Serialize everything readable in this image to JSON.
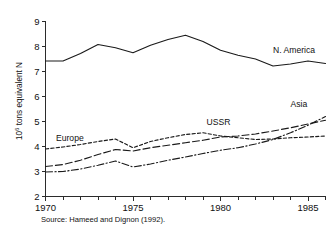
{
  "figure": {
    "caption": "Source: Hameed and Dignon (1992)."
  },
  "chart_data": {
    "type": "line",
    "title": "",
    "xlabel": "",
    "ylabel": "10⁶ tons equivalent N",
    "ylabel_base": "10",
    "ylabel_exponent": "6",
    "ylabel_rest": " tons equivalent N",
    "xlim": [
      1970,
      1986
    ],
    "ylim": [
      2,
      9
    ],
    "grid": false,
    "legend_position": "inline-labels",
    "y_ticks": [
      2,
      3,
      4,
      5,
      6,
      7,
      8,
      9
    ],
    "y_tick_labels": [
      "2",
      "3",
      "4",
      "5",
      "6",
      "7",
      "8",
      "9"
    ],
    "x_ticks_major": [
      1970,
      1975,
      1980,
      1985
    ],
    "x_tick_labels": [
      "1970",
      "1975",
      "1980",
      "1985"
    ],
    "x_ticks_minor": [
      1971,
      1972,
      1973,
      1974,
      1976,
      1977,
      1978,
      1979,
      1981,
      1982,
      1983,
      1984,
      1986
    ],
    "x": [
      1970,
      1971,
      1972,
      1973,
      1974,
      1975,
      1976,
      1977,
      1978,
      1979,
      1980,
      1981,
      1982,
      1983,
      1984,
      1985,
      1986
    ],
    "series": [
      {
        "name": "N. America",
        "label": "N. America",
        "style": "solid",
        "dasharray": "",
        "label_x": 1983.0,
        "label_y": 7.75,
        "values": [
          7.42,
          7.42,
          7.72,
          8.08,
          7.95,
          7.75,
          8.05,
          8.28,
          8.45,
          8.2,
          7.85,
          7.65,
          7.5,
          7.22,
          7.3,
          7.42,
          7.32
        ]
      },
      {
        "name": "Europe",
        "label": "Europe",
        "style": "short-dash",
        "dasharray": "3.2,2.2",
        "label_x": 1970.6,
        "label_y": 4.22,
        "values": [
          3.9,
          3.98,
          4.08,
          4.2,
          4.3,
          3.95,
          4.2,
          4.35,
          4.48,
          4.55,
          4.42,
          4.35,
          4.28,
          4.3,
          4.35,
          4.38,
          4.42
        ]
      },
      {
        "name": "USSR",
        "label": "USSR",
        "style": "long-dash",
        "dasharray": "7,3",
        "label_x": 1979.2,
        "label_y": 4.85,
        "values": [
          3.2,
          3.28,
          3.45,
          3.68,
          3.88,
          3.82,
          3.95,
          4.05,
          4.15,
          4.25,
          4.38,
          4.42,
          4.5,
          4.62,
          4.75,
          4.9,
          5.05
        ]
      },
      {
        "name": "Asia",
        "label": "Asia",
        "style": "dash-dot",
        "dasharray": "7,2.4,1.2,2.4",
        "label_x": 1984.0,
        "label_y": 5.58,
        "values": [
          2.98,
          3.0,
          3.1,
          3.25,
          3.42,
          3.18,
          3.3,
          3.45,
          3.58,
          3.72,
          3.85,
          3.95,
          4.1,
          4.28,
          4.55,
          4.85,
          5.2
        ]
      }
    ]
  }
}
